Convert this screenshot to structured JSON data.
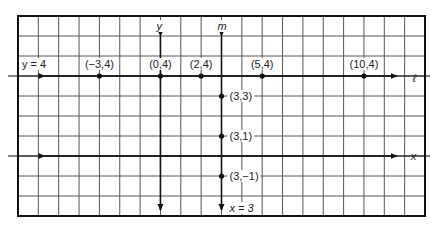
{
  "diagram": {
    "grid": {
      "x_min": -7,
      "x_max": 13,
      "y_min": -3,
      "y_max": 7,
      "line_color": "#555555"
    },
    "axes": {
      "x_label": "x",
      "y_label": "y"
    },
    "lines": {
      "l": {
        "equation": "y = 4",
        "name": "ℓ"
      },
      "m": {
        "equation": "x = 3",
        "name": "m"
      }
    },
    "points_on_l": [
      {
        "label": "(−3,4)",
        "x": -3,
        "y": 4
      },
      {
        "label": "(0,4)",
        "x": 0,
        "y": 4
      },
      {
        "label": "(2,4)",
        "x": 2,
        "y": 4
      },
      {
        "label": "(5,4)",
        "x": 5,
        "y": 4
      },
      {
        "label": "(10,4)",
        "x": 10,
        "y": 4
      }
    ],
    "points_on_m": [
      {
        "label": "(3,3)",
        "x": 3,
        "y": 3
      },
      {
        "label": "(3,1)",
        "x": 3,
        "y": 1
      },
      {
        "label": "(3,−1)",
        "x": 3,
        "y": -1
      }
    ]
  }
}
